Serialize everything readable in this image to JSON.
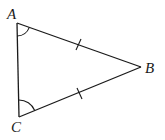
{
  "diagram": {
    "type": "isosceles-triangle",
    "vertices": [
      {
        "id": "A",
        "label": "A",
        "x": 17,
        "y": 23
      },
      {
        "id": "B",
        "label": "B",
        "x": 141,
        "y": 67
      },
      {
        "id": "C",
        "label": "C",
        "x": 19,
        "y": 117
      }
    ],
    "edges": [
      {
        "from": "A",
        "to": "B",
        "tick_marks": 1
      },
      {
        "from": "C",
        "to": "B",
        "tick_marks": 1
      },
      {
        "from": "A",
        "to": "C",
        "tick_marks": 0
      }
    ],
    "angle_marks": [
      {
        "vertex": "A",
        "arcs": 1
      },
      {
        "vertex": "C",
        "arcs": 1
      }
    ],
    "colors": {
      "stroke": "#1a1a1a",
      "background": "#ffffff"
    }
  }
}
